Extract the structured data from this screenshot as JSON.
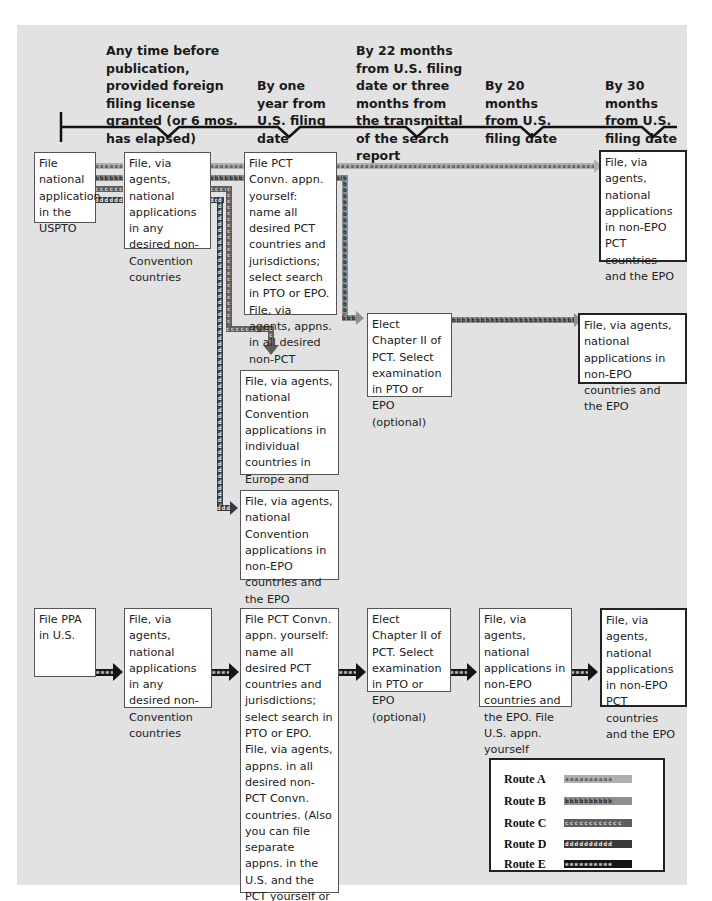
{
  "timeline": {
    "milestones": [
      {
        "label": "Any time before publication, provided foreign filing license granted (or 6 mos. has elapsed)"
      },
      {
        "label": "By one year from U.S. filing date"
      },
      {
        "label": "By 22 months from U.S. filing date or three months from the transmittal of the search report"
      },
      {
        "label": "By 20 months from U.S. filing date"
      },
      {
        "label": "By 30 months from U.S. filing date"
      }
    ]
  },
  "boxes": {
    "file_national_uspto": "File national application in the USPTO",
    "file_non_convention_top": "File, via agents, national applications in any desired non-Convention countries",
    "file_pct_top": "File PCT Convn. appn. yourself: name all desired PCT countries and jurisdictions; select search in PTO or EPO. File, via agents, appns. in all desired non-PCT Convn. countries",
    "file_non_epo_pct_top": "File, via agents, national applications in non-EPO PCT countries and the EPO",
    "elect_chapter_ii_top": "Elect Chapter II of PCT. Select examination in PTO or EPO (optional)",
    "file_non_epo_countries_mid": "File, via agents, national applications in non-EPO countries and the EPO",
    "file_convention_europe": "File, via agents, national Convention applications in individual countries in Europe and elsewhere",
    "file_convention_non_epo": "File, via agents, national Convention applications in non-EPO countries and the EPO",
    "file_ppa": "File PPA in U.S.",
    "file_non_convention_bottom": "File, via agents, national applications in any desired non-Convention countries",
    "file_pct_bottom": "File PCT Convn. appn. yourself: name all desired PCT countries and jurisdictions; select search in PTO or EPO. File, via agents, appns. in all desired non-PCT Convn. countries. (Also you can file separate appns. in the U.S. and the PCT yourself or you can file separate appns. in the U.S. and take Route C or Route D)",
    "elect_chapter_ii_bottom": "Elect Chapter II of PCT. Select examination in PTO or EPO (optional)",
    "file_non_epo_us_bottom": "File, via agents, national applications in non-EPO countries and the EPO. File U.S. appn. yourself",
    "file_non_epo_pct_bottom": "File, via agents, national applications in non-EPO PCT countries and the EPO"
  },
  "route_markers": {
    "a": "aaaaaaaaaaaaaaaaaaaaaaaaaaaaaaaaaaaaaaaaaaaaaaaaaaaaaaaa",
    "b": "bbbbbbbbbbbbbbbbbbbbbbbbbbbbbbbbbbbbbbbbbbbbbbbbbbbbbbbb",
    "c": "cccccccccccccccccccccccccccccccccccccccccccccccccccccccc",
    "d": "dddddddddddddddddddddddddddddddddddddddddddddddddddddddd",
    "e": "eeeeeeeeeeeeeeeeeeeeeeeeeeeeeeeeeeeeeeeeeeeeeeeeeeeeeeee"
  },
  "legend": {
    "items": [
      {
        "label": "Route A",
        "marker": "aaaaaaaaaa",
        "color": "#b0b0b0"
      },
      {
        "label": "Route B",
        "marker": "bbbbbbbbbb",
        "color": "#8e8e8e"
      },
      {
        "label": "Route C",
        "marker": "cccccccccccc",
        "color": "#5e5e5e"
      },
      {
        "label": "Route D",
        "marker": "dddddddddd",
        "color": "#3a3a3a"
      },
      {
        "label": "Route E",
        "marker": "eeeeeeeeee",
        "color": "#141414"
      }
    ]
  },
  "colors": {
    "panel_bg": "#e2e2e2",
    "route_a": "#b0b0b0",
    "route_b": "#8e8e8e",
    "route_c": "#5e5e5e",
    "route_d": "#3a3a3a",
    "route_e": "#141414"
  }
}
